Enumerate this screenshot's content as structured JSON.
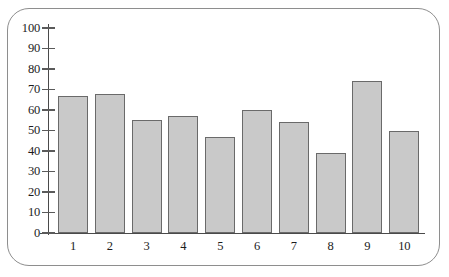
{
  "chart_data": {
    "type": "bar",
    "title": "",
    "subtitle": "",
    "xlabel": "",
    "ylabel": "",
    "categories": [
      "1",
      "2",
      "3",
      "4",
      "5",
      "6",
      "7",
      "8",
      "9",
      "10"
    ],
    "values": [
      67,
      68,
      55,
      57,
      47,
      60,
      54,
      39,
      74,
      50
    ],
    "series": [
      {
        "name": "",
        "values": [
          67,
          68,
          55,
          57,
          47,
          60,
          54,
          39,
          74,
          50
        ]
      }
    ],
    "ylim": [
      0,
      100
    ],
    "yticks": [
      0,
      10,
      20,
      30,
      40,
      50,
      60,
      70,
      80,
      90,
      100
    ],
    "ytick_labels": [
      "0",
      "10",
      "20",
      "30",
      "40",
      "50",
      "60",
      "70",
      "80",
      "90",
      "100"
    ],
    "xtick_labels": [
      "1",
      "2",
      "3",
      "4",
      "5",
      "6",
      "7",
      "8",
      "9",
      "10"
    ],
    "grid": false,
    "legend": null,
    "legend_position": "none",
    "annotations": [],
    "colors": {
      "bar_fill": "#c9c9c9",
      "bar_edge": "#6a6a6a",
      "axis": "#4a4a4a",
      "text": "#1c1c1c",
      "frame_border": "#8e8e8e",
      "background": "#ffffff"
    }
  }
}
